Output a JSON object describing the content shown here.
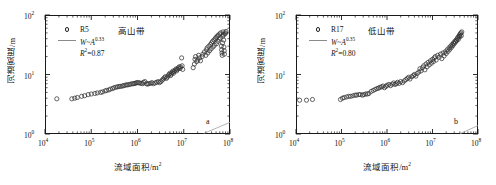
{
  "figure": {
    "panel_count": 2
  },
  "axes": {
    "xlabel": "流域面积/m²",
    "ylabel": "河道宽度/m",
    "x_ticks": [
      "10⁴",
      "10⁵",
      "10⁶",
      "10⁷",
      "10⁸"
    ],
    "y_ticks": [
      "10⁰",
      "10¹",
      "10²"
    ]
  },
  "panel_a": {
    "tag": "a",
    "series_label": "R5",
    "zone": "高山带",
    "fit_base": "W~A",
    "fit_exponent": "0.33",
    "r2_label": "R",
    "r2_sup": "2",
    "r2_value": "=0.87"
  },
  "panel_b": {
    "tag": "b",
    "series_label": "R17",
    "zone": "低山带",
    "fit_base": "W~A",
    "fit_exponent": "0.35",
    "r2_label": "R",
    "r2_sup": "2",
    "r2_value": "=0.80"
  },
  "chart_data": [
    {
      "type": "scatter",
      "panel": "a",
      "title": "高山带",
      "series_name": "R5",
      "xlabel": "流域面积/m²",
      "ylabel": "河道宽度/m",
      "xscale": "log",
      "yscale": "log",
      "xlim": [
        10000,
        100000000
      ],
      "ylim": [
        1,
        100
      ],
      "grid": false,
      "legend_position": "top-left",
      "marker": "open-circle",
      "fit_line": {
        "label": "W~A^0.33",
        "exponent": 0.33,
        "coefficient": 0.0036,
        "r_squared": 0.87,
        "color": "#999999"
      },
      "points": [
        [
          18000,
          3.9
        ],
        [
          38000,
          3.9
        ],
        [
          44000,
          4.0
        ],
        [
          50000,
          4.1
        ],
        [
          62000,
          4.3
        ],
        [
          72000,
          4.4
        ],
        [
          86000,
          4.6
        ],
        [
          100000,
          4.7
        ],
        [
          120000,
          4.8
        ],
        [
          135000,
          4.9
        ],
        [
          160000,
          5.0
        ],
        [
          175000,
          5.1
        ],
        [
          200000,
          5.3
        ],
        [
          215000,
          5.4
        ],
        [
          240000,
          5.5
        ],
        [
          260000,
          5.7
        ],
        [
          290000,
          5.8
        ],
        [
          310000,
          6.0
        ],
        [
          340000,
          6.1
        ],
        [
          370000,
          6.2
        ],
        [
          400000,
          6.3
        ],
        [
          430000,
          6.3
        ],
        [
          470000,
          6.4
        ],
        [
          500000,
          6.5
        ],
        [
          540000,
          6.6
        ],
        [
          580000,
          6.7
        ],
        [
          620000,
          6.7
        ],
        [
          670000,
          6.8
        ],
        [
          720000,
          6.9
        ],
        [
          780000,
          7.0
        ],
        [
          830000,
          7.0
        ],
        [
          880000,
          7.1
        ],
        [
          930000,
          7.2
        ],
        [
          980000,
          7.3
        ],
        [
          1050000,
          7.3
        ],
        [
          1120000,
          7.2
        ],
        [
          1200000,
          7.1
        ],
        [
          1280000,
          7.0
        ],
        [
          1350000,
          7.4
        ],
        [
          1450000,
          7.6
        ],
        [
          1550000,
          7.0
        ],
        [
          1650000,
          6.9
        ],
        [
          1750000,
          7.0
        ],
        [
          1900000,
          7.1
        ],
        [
          2050000,
          7.3
        ],
        [
          2200000,
          7.0
        ],
        [
          2400000,
          7.2
        ],
        [
          2600000,
          7.4
        ],
        [
          2800000,
          7.6
        ],
        [
          3000000,
          7.3
        ],
        [
          3200000,
          7.6
        ],
        [
          3400000,
          8.0
        ],
        [
          3600000,
          8.4
        ],
        [
          3800000,
          8.8
        ],
        [
          4000000,
          9.2
        ],
        [
          4200000,
          8.6
        ],
        [
          4400000,
          9.0
        ],
        [
          4600000,
          9.5
        ],
        [
          4800000,
          10.0
        ],
        [
          5000000,
          10.5
        ],
        [
          5200000,
          9.6
        ],
        [
          5400000,
          10.2
        ],
        [
          5600000,
          10.8
        ],
        [
          5800000,
          11.4
        ],
        [
          6000000,
          10.5
        ],
        [
          6200000,
          11.2
        ],
        [
          6500000,
          11.8
        ],
        [
          6800000,
          12.4
        ],
        [
          7000000,
          11.5
        ],
        [
          7300000,
          12.2
        ],
        [
          7600000,
          12.9
        ],
        [
          8000000,
          13.5
        ],
        [
          8300000,
          12.6
        ],
        [
          8600000,
          13.4
        ],
        [
          9000000,
          19.0
        ],
        [
          9200000,
          14.0
        ],
        [
          9500000,
          12.2
        ],
        [
          16000000,
          13.0
        ],
        [
          17000000,
          15.0
        ],
        [
          17500000,
          18.0
        ],
        [
          18000000,
          20.0
        ],
        [
          19000000,
          16.5
        ],
        [
          20000000,
          17.5
        ],
        [
          21000000,
          21.0
        ],
        [
          22000000,
          19.0
        ],
        [
          23000000,
          17.0
        ],
        [
          25000000,
          20.0
        ],
        [
          26000000,
          22.0
        ],
        [
          28000000,
          24.0
        ],
        [
          30000000,
          21.0
        ],
        [
          31000000,
          26.0
        ],
        [
          32000000,
          28.0
        ],
        [
          33000000,
          23.0
        ],
        [
          35000000,
          30.0
        ],
        [
          36000000,
          25.0
        ],
        [
          38000000,
          32.0
        ],
        [
          39000000,
          27.0
        ],
        [
          40000000,
          34.0
        ],
        [
          42000000,
          36.0
        ],
        [
          43000000,
          29.0
        ],
        [
          45000000,
          38.0
        ],
        [
          46000000,
          31.0
        ],
        [
          48000000,
          40.0
        ],
        [
          50000000,
          42.0
        ],
        [
          51000000,
          33.0
        ],
        [
          53000000,
          44.0
        ],
        [
          55000000,
          36.0
        ],
        [
          56000000,
          46.0
        ],
        [
          58000000,
          39.0
        ],
        [
          60000000,
          48.0
        ],
        [
          62000000,
          41.0
        ],
        [
          63000000,
          50.0
        ],
        [
          65000000,
          30.0
        ],
        [
          66000000,
          26.0
        ],
        [
          67000000,
          23.0
        ],
        [
          68000000,
          21.0
        ],
        [
          69000000,
          34.0
        ],
        [
          70000000,
          44.0
        ],
        [
          71000000,
          52.0
        ],
        [
          72000000,
          47.0
        ],
        [
          73000000,
          38.0
        ],
        [
          74000000,
          29.0
        ],
        [
          75000000,
          25.0
        ],
        [
          76000000,
          22.0
        ],
        [
          78000000,
          48.0
        ],
        [
          80000000,
          50.0
        ],
        [
          82000000,
          53.0
        ]
      ]
    },
    {
      "type": "scatter",
      "panel": "b",
      "title": "低山带",
      "series_name": "R17",
      "xlabel": "流域面积/m²",
      "ylabel": "河道宽度/m",
      "xscale": "log",
      "yscale": "log",
      "xlim": [
        10000,
        100000000
      ],
      "ylim": [
        1,
        100
      ],
      "grid": false,
      "legend_position": "top-left",
      "marker": "open-circle",
      "fit_line": {
        "label": "W~A^0.35",
        "exponent": 0.35,
        "coefficient": 0.0022,
        "r_squared": 0.8,
        "color": "#999999"
      },
      "points": [
        [
          12000,
          3.7
        ],
        [
          17000,
          3.7
        ],
        [
          23000,
          3.8
        ],
        [
          95000,
          3.8
        ],
        [
          105000,
          4.0
        ],
        [
          115000,
          4.1
        ],
        [
          130000,
          4.2
        ],
        [
          145000,
          4.3
        ],
        [
          160000,
          4.3
        ],
        [
          180000,
          4.4
        ],
        [
          200000,
          4.5
        ],
        [
          215000,
          4.5
        ],
        [
          240000,
          4.6
        ],
        [
          260000,
          4.6
        ],
        [
          290000,
          4.5
        ],
        [
          310000,
          4.6
        ],
        [
          340000,
          4.7
        ],
        [
          370000,
          4.7
        ],
        [
          400000,
          4.8
        ],
        [
          450000,
          5.2
        ],
        [
          500000,
          5.4
        ],
        [
          550000,
          5.6
        ],
        [
          600000,
          5.8
        ],
        [
          650000,
          5.9
        ],
        [
          700000,
          6.1
        ],
        [
          760000,
          6.2
        ],
        [
          820000,
          6.4
        ],
        [
          880000,
          6.0
        ],
        [
          950000,
          6.3
        ],
        [
          1000000,
          6.6
        ],
        [
          1100000,
          6.8
        ],
        [
          1200000,
          6.5
        ],
        [
          1300000,
          6.9
        ],
        [
          1400000,
          7.2
        ],
        [
          1500000,
          6.8
        ],
        [
          1600000,
          7.0
        ],
        [
          1700000,
          7.4
        ],
        [
          1850000,
          7.1
        ],
        [
          2000000,
          7.6
        ],
        [
          2200000,
          7.3
        ],
        [
          2400000,
          7.8
        ],
        [
          2600000,
          8.2
        ],
        [
          2800000,
          8.6
        ],
        [
          3000000,
          9.0
        ],
        [
          3200000,
          8.4
        ],
        [
          3500000,
          9.2
        ],
        [
          3800000,
          9.6
        ],
        [
          4000000,
          10.0
        ],
        [
          4300000,
          9.4
        ],
        [
          4600000,
          10.4
        ],
        [
          5000000,
          11.0
        ],
        [
          5300000,
          12.5
        ],
        [
          5600000,
          11.5
        ],
        [
          6000000,
          13.0
        ],
        [
          6400000,
          14.0
        ],
        [
          6800000,
          12.0
        ],
        [
          7200000,
          15.0
        ],
        [
          7600000,
          13.5
        ],
        [
          8000000,
          16.0
        ],
        [
          8500000,
          14.5
        ],
        [
          9000000,
          17.0
        ],
        [
          9500000,
          15.5
        ],
        [
          10000000,
          18.0
        ],
        [
          10500000,
          16.5
        ],
        [
          11000000,
          19.0
        ],
        [
          11500000,
          20.0
        ],
        [
          12000000,
          17.5
        ],
        [
          13000000,
          21.0
        ],
        [
          14000000,
          19.5
        ],
        [
          15000000,
          22.0
        ],
        [
          16000000,
          18.5
        ],
        [
          17000000,
          23.0
        ],
        [
          18000000,
          20.5
        ],
        [
          19000000,
          24.0
        ],
        [
          20000000,
          22.5
        ],
        [
          21000000,
          26.0
        ],
        [
          22000000,
          24.5
        ],
        [
          23000000,
          28.0
        ],
        [
          24000000,
          26.5
        ],
        [
          25000000,
          30.0
        ],
        [
          26000000,
          28.5
        ],
        [
          27000000,
          32.0
        ],
        [
          28000000,
          30.5
        ],
        [
          29000000,
          34.0
        ],
        [
          30000000,
          33.0
        ],
        [
          31000000,
          36.0
        ],
        [
          32000000,
          35.0
        ],
        [
          33000000,
          38.0
        ],
        [
          34000000,
          37.0
        ],
        [
          35000000,
          40.0
        ],
        [
          36000000,
          42.0
        ],
        [
          37000000,
          39.0
        ],
        [
          38000000,
          44.0
        ],
        [
          39000000,
          46.0
        ],
        [
          40000000,
          43.0
        ],
        [
          41000000,
          48.0
        ],
        [
          42000000,
          50.0
        ],
        [
          43000000,
          45.0
        ],
        [
          44000000,
          52.0
        ]
      ]
    }
  ]
}
